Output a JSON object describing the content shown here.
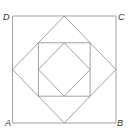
{
  "figure": {
    "labels": {
      "A": "A",
      "B": "B",
      "C": "C",
      "D": "D"
    },
    "colors": {
      "stroke": "#8a8a8a",
      "label": "#333333",
      "background": "#ffffff"
    }
  }
}
